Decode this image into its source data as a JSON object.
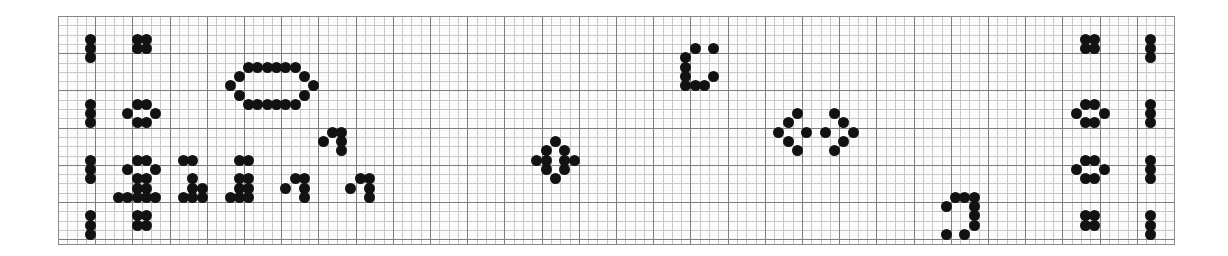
{
  "document": {
    "title": "Dot-matrix grid pattern sheet",
    "description": "Scanned graph-paper sheet with hand-marked black dot glyph patterns",
    "media": "graph paper scan"
  },
  "colors": {
    "background": "#ffffff",
    "paper": "#fdfdfd",
    "dot": "#121212",
    "grid_major": "#7e7e7e",
    "grid_minor": "#c9c9c9",
    "border": "#8a8a8a"
  },
  "grid": {
    "origin_x": 58,
    "origin_y": 16,
    "width": 1117,
    "height": 229,
    "cell_size": 9.3,
    "major_every": 4,
    "columns": 120,
    "rows": 24
  },
  "chart_data": {
    "type": "scatter",
    "xlabel": "",
    "ylabel": "",
    "xlim": [
      0,
      120
    ],
    "ylim": [
      0,
      24
    ],
    "grid": true,
    "legend": null,
    "note": "Each datum is a filled black dot occupying one grid cell; coordinates are column,row indices from the top-left of the ruled area."
  },
  "glyphs": [
    {
      "name": "left-margin-bar-1",
      "kind": "vertical-bar",
      "dots": [
        [
          3,
          2
        ],
        [
          3,
          3
        ],
        [
          3,
          4
        ]
      ]
    },
    {
      "name": "left-margin-bar-2",
      "kind": "vertical-bar",
      "dots": [
        [
          3,
          9
        ],
        [
          3,
          10
        ],
        [
          3,
          11
        ]
      ]
    },
    {
      "name": "left-margin-bar-3",
      "kind": "vertical-bar",
      "dots": [
        [
          3,
          15
        ],
        [
          3,
          16
        ],
        [
          3,
          17
        ]
      ]
    },
    {
      "name": "left-margin-bar-4",
      "kind": "vertical-bar",
      "dots": [
        [
          3,
          21
        ],
        [
          3,
          22
        ],
        [
          3,
          23
        ]
      ]
    },
    {
      "name": "left-square-block-1",
      "kind": "square-cluster",
      "dots": [
        [
          8,
          2
        ],
        [
          9,
          2
        ],
        [
          8,
          3
        ],
        [
          9,
          3
        ]
      ]
    },
    {
      "name": "left-ring-2",
      "kind": "ring",
      "dots": [
        [
          8,
          9
        ],
        [
          9,
          9
        ],
        [
          7,
          10
        ],
        [
          10,
          10
        ],
        [
          8,
          11
        ],
        [
          9,
          11
        ]
      ]
    },
    {
      "name": "left-ring-3",
      "kind": "ring",
      "dots": [
        [
          8,
          15
        ],
        [
          9,
          15
        ],
        [
          7,
          16
        ],
        [
          10,
          16
        ],
        [
          8,
          17
        ],
        [
          9,
          17
        ]
      ]
    },
    {
      "name": "left-square-block-4",
      "kind": "square-cluster",
      "dots": [
        [
          8,
          21
        ],
        [
          9,
          21
        ],
        [
          8,
          22
        ],
        [
          9,
          22
        ]
      ]
    },
    {
      "name": "large-oval-loop",
      "kind": "closed-loop",
      "dots": [
        [
          20,
          5
        ],
        [
          21,
          5
        ],
        [
          22,
          5
        ],
        [
          23,
          5
        ],
        [
          24,
          5
        ],
        [
          25,
          5
        ],
        [
          19,
          6
        ],
        [
          26,
          6
        ],
        [
          18,
          7
        ],
        [
          27,
          7
        ],
        [
          19,
          8
        ],
        [
          26,
          8
        ],
        [
          20,
          9
        ],
        [
          21,
          9
        ],
        [
          22,
          9
        ],
        [
          23,
          9
        ],
        [
          24,
          9
        ],
        [
          25,
          9
        ]
      ]
    },
    {
      "name": "bridge-segment-left",
      "kind": "horizontal-pair",
      "dots": [
        [
          13,
          15
        ],
        [
          14,
          15
        ]
      ]
    },
    {
      "name": "bridge-segment-right",
      "kind": "horizontal-pair",
      "dots": [
        [
          19,
          15
        ],
        [
          20,
          15
        ]
      ]
    },
    {
      "name": "stair-glyph-a",
      "kind": "stair",
      "dots": [
        [
          8,
          18
        ],
        [
          9,
          18
        ],
        [
          7,
          19
        ],
        [
          8,
          19
        ],
        [
          9,
          19
        ],
        [
          10,
          19
        ],
        [
          6,
          19
        ]
      ]
    },
    {
      "name": "stair-glyph-b",
      "kind": "stair",
      "dots": [
        [
          14,
          17
        ],
        [
          14,
          18
        ],
        [
          15,
          18
        ],
        [
          13,
          19
        ],
        [
          14,
          19
        ],
        [
          15,
          19
        ]
      ]
    },
    {
      "name": "stair-glyph-c",
      "kind": "stair",
      "dots": [
        [
          19,
          17
        ],
        [
          20,
          17
        ],
        [
          19,
          18
        ],
        [
          20,
          18
        ],
        [
          18,
          19
        ],
        [
          19,
          19
        ],
        [
          20,
          19
        ]
      ]
    },
    {
      "name": "hook-glyph-upper",
      "kind": "hook",
      "dots": [
        [
          29,
          12
        ],
        [
          30,
          12
        ],
        [
          28,
          13
        ],
        [
          30,
          13
        ],
        [
          30,
          14
        ]
      ]
    },
    {
      "name": "hook-glyph-lower",
      "kind": "hook",
      "dots": [
        [
          25,
          17
        ],
        [
          26,
          17
        ],
        [
          26,
          18
        ],
        [
          24,
          18
        ],
        [
          26,
          19
        ]
      ]
    },
    {
      "name": "hook-glyph-right",
      "kind": "hook",
      "dots": [
        [
          32,
          17
        ],
        [
          33,
          17
        ],
        [
          33,
          18
        ],
        [
          31,
          18
        ],
        [
          33,
          19
        ]
      ]
    },
    {
      "name": "diamond-rosette",
      "kind": "rosette",
      "dots": [
        [
          53,
          13
        ],
        [
          52,
          14
        ],
        [
          54,
          14
        ],
        [
          51,
          15
        ],
        [
          52,
          15
        ],
        [
          54,
          15
        ],
        [
          55,
          15
        ],
        [
          52,
          16
        ],
        [
          54,
          16
        ],
        [
          53,
          17
        ]
      ]
    },
    {
      "name": "c-bracket-glyph",
      "kind": "bracket",
      "dots": [
        [
          68,
          3
        ],
        [
          70,
          3
        ],
        [
          67,
          4
        ],
        [
          67,
          5
        ],
        [
          67,
          6
        ],
        [
          70,
          6
        ],
        [
          67,
          7
        ],
        [
          68,
          7
        ],
        [
          69,
          7
        ]
      ]
    },
    {
      "name": "zigzag-left-wing",
      "kind": "zigzag",
      "dots": [
        [
          79,
          10
        ],
        [
          78,
          11
        ],
        [
          77,
          12
        ],
        [
          78,
          13
        ],
        [
          79,
          14
        ]
      ]
    },
    {
      "name": "zigzag-center-dot",
      "kind": "single",
      "dots": [
        [
          80,
          12
        ]
      ]
    },
    {
      "name": "zigzag-right-wing",
      "kind": "zigzag",
      "dots": [
        [
          83,
          10
        ],
        [
          84,
          11
        ],
        [
          85,
          12
        ],
        [
          84,
          13
        ],
        [
          83,
          14
        ]
      ]
    },
    {
      "name": "zigzag-inner-dot",
      "kind": "single",
      "dots": [
        [
          82,
          12
        ]
      ]
    },
    {
      "name": "j-hook-glyph",
      "kind": "hook",
      "dots": [
        [
          96,
          19
        ],
        [
          97,
          19
        ],
        [
          98,
          19
        ],
        [
          95,
          20
        ],
        [
          98,
          20
        ],
        [
          98,
          21
        ],
        [
          98,
          22
        ],
        [
          95,
          23
        ],
        [
          97,
          23
        ]
      ]
    },
    {
      "name": "right-square-block-1",
      "kind": "square-cluster",
      "dots": [
        [
          110,
          2
        ],
        [
          111,
          2
        ],
        [
          110,
          3
        ],
        [
          111,
          3
        ]
      ]
    },
    {
      "name": "right-ring-2",
      "kind": "ring",
      "dots": [
        [
          110,
          9
        ],
        [
          111,
          9
        ],
        [
          109,
          10
        ],
        [
          112,
          10
        ],
        [
          110,
          11
        ],
        [
          111,
          11
        ]
      ]
    },
    {
      "name": "right-ring-3",
      "kind": "ring",
      "dots": [
        [
          110,
          15
        ],
        [
          111,
          15
        ],
        [
          109,
          16
        ],
        [
          112,
          16
        ],
        [
          110,
          17
        ],
        [
          111,
          17
        ]
      ]
    },
    {
      "name": "right-square-block-4",
      "kind": "square-cluster",
      "dots": [
        [
          110,
          21
        ],
        [
          111,
          21
        ],
        [
          110,
          22
        ],
        [
          111,
          22
        ]
      ]
    },
    {
      "name": "right-margin-bar-1",
      "kind": "vertical-bar",
      "dots": [
        [
          117,
          2
        ],
        [
          117,
          3
        ],
        [
          117,
          4
        ]
      ]
    },
    {
      "name": "right-margin-bar-2",
      "kind": "vertical-bar",
      "dots": [
        [
          117,
          9
        ],
        [
          117,
          10
        ],
        [
          117,
          11
        ]
      ]
    },
    {
      "name": "right-margin-bar-3",
      "kind": "vertical-bar",
      "dots": [
        [
          117,
          15
        ],
        [
          117,
          16
        ],
        [
          117,
          17
        ]
      ]
    },
    {
      "name": "right-margin-bar-4",
      "kind": "vertical-bar",
      "dots": [
        [
          117,
          21
        ],
        [
          117,
          22
        ],
        [
          117,
          23
        ]
      ]
    }
  ]
}
